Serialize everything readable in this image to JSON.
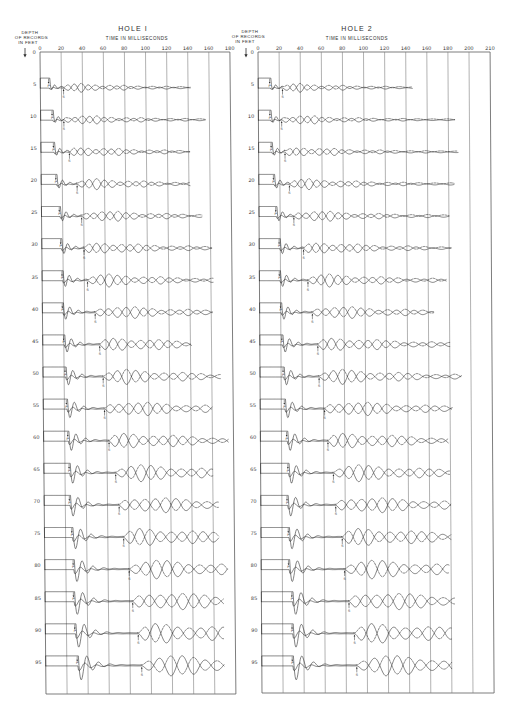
{
  "icons": {
    "depth_direction": "down-arrow"
  },
  "chart_data": [
    {
      "type": "line",
      "title": "HOLE I",
      "xlabel": "TIME IN MILLISECONDS",
      "ylabel": "DEPTH OF RECORDS IN FEET",
      "ylabel_lines": [
        "DEPTH",
        "OF RECORDS",
        "IN FEET"
      ],
      "x_ticks": [
        0,
        20,
        40,
        60,
        80,
        100,
        120,
        140,
        160,
        180
      ],
      "y_ticks": [
        0,
        5,
        10,
        15,
        20,
        25,
        30,
        35,
        40,
        45,
        50,
        55,
        60,
        65,
        70,
        75,
        80,
        85,
        90,
        95
      ],
      "xlim": [
        0,
        180
      ],
      "ylim": [
        0,
        95
      ],
      "y_direction": "down",
      "grid": true,
      "marker_labels": {
        "p": "P",
        "s": "S"
      },
      "records": [
        {
          "depth": 5,
          "p_ms": 9,
          "s_ms": 22,
          "end_ms": 142
        },
        {
          "depth": 10,
          "p_ms": 12,
          "s_ms": 22,
          "end_ms": 156
        },
        {
          "depth": 15,
          "p_ms": 13,
          "s_ms": 27,
          "end_ms": 141
        },
        {
          "depth": 20,
          "p_ms": 15,
          "s_ms": 34,
          "end_ms": 141
        },
        {
          "depth": 25,
          "p_ms": 18,
          "s_ms": 38,
          "end_ms": 152
        },
        {
          "depth": 30,
          "p_ms": 19,
          "s_ms": 40,
          "end_ms": 161
        },
        {
          "depth": 35,
          "p_ms": 20,
          "s_ms": 43,
          "end_ms": 162
        },
        {
          "depth": 40,
          "p_ms": 20,
          "s_ms": 50,
          "end_ms": 161
        },
        {
          "depth": 45,
          "p_ms": 21,
          "s_ms": 54,
          "end_ms": 141
        },
        {
          "depth": 50,
          "p_ms": 22,
          "s_ms": 57,
          "end_ms": 168
        },
        {
          "depth": 55,
          "p_ms": 23,
          "s_ms": 58,
          "end_ms": 160
        },
        {
          "depth": 60,
          "p_ms": 24,
          "s_ms": 62,
          "end_ms": 175
        },
        {
          "depth": 65,
          "p_ms": 25,
          "s_ms": 68,
          "end_ms": 160
        },
        {
          "depth": 70,
          "p_ms": 25,
          "s_ms": 71,
          "end_ms": 165
        },
        {
          "depth": 75,
          "p_ms": 27,
          "s_ms": 75,
          "end_ms": 165
        },
        {
          "depth": 80,
          "p_ms": 28,
          "s_ms": 80,
          "end_ms": 173
        },
        {
          "depth": 85,
          "p_ms": 28,
          "s_ms": 83,
          "end_ms": 169
        },
        {
          "depth": 90,
          "p_ms": 29,
          "s_ms": 88,
          "end_ms": 169
        },
        {
          "depth": 95,
          "p_ms": 31,
          "s_ms": 91,
          "end_ms": 169
        }
      ]
    },
    {
      "type": "line",
      "title": "HOLE 2",
      "xlabel": "TIME IN MILLISECONDS",
      "ylabel": "DEPTH OF RECORDS IN FEET",
      "ylabel_lines": [
        "DEPTH",
        "OF RECORDS",
        "IN FEET"
      ],
      "x_ticks": [
        0,
        20,
        40,
        60,
        80,
        100,
        120,
        140,
        160,
        180,
        200,
        210
      ],
      "y_ticks": [
        0,
        5,
        10,
        15,
        20,
        25,
        30,
        35,
        40,
        45,
        50,
        55,
        60,
        65,
        70,
        75,
        80,
        85,
        90,
        95
      ],
      "xlim": [
        0,
        210
      ],
      "ylim": [
        0,
        95
      ],
      "y_direction": "down",
      "grid": true,
      "marker_labels": {
        "p": "P",
        "s": "S"
      },
      "records": [
        {
          "depth": 5,
          "p_ms": 12,
          "s_ms": 23,
          "end_ms": 146
        },
        {
          "depth": 10,
          "p_ms": 12,
          "s_ms": 22,
          "end_ms": 186
        },
        {
          "depth": 15,
          "p_ms": 13,
          "s_ms": 25,
          "end_ms": 189
        },
        {
          "depth": 20,
          "p_ms": 15,
          "s_ms": 29,
          "end_ms": 185
        },
        {
          "depth": 25,
          "p_ms": 17,
          "s_ms": 33,
          "end_ms": 180
        },
        {
          "depth": 30,
          "p_ms": 20,
          "s_ms": 42,
          "end_ms": 182
        },
        {
          "depth": 35,
          "p_ms": 20,
          "s_ms": 46,
          "end_ms": 177
        },
        {
          "depth": 40,
          "p_ms": 21,
          "s_ms": 50,
          "end_ms": 165
        },
        {
          "depth": 45,
          "p_ms": 22,
          "s_ms": 55,
          "end_ms": 180
        },
        {
          "depth": 50,
          "p_ms": 23,
          "s_ms": 56,
          "end_ms": 191
        },
        {
          "depth": 55,
          "p_ms": 24,
          "s_ms": 61,
          "end_ms": 182
        },
        {
          "depth": 60,
          "p_ms": 26,
          "s_ms": 64,
          "end_ms": 178
        },
        {
          "depth": 65,
          "p_ms": 27,
          "s_ms": 69,
          "end_ms": 179
        },
        {
          "depth": 70,
          "p_ms": 26,
          "s_ms": 71,
          "end_ms": 180
        },
        {
          "depth": 75,
          "p_ms": 27,
          "s_ms": 77,
          "end_ms": 180
        },
        {
          "depth": 80,
          "p_ms": 27,
          "s_ms": 79,
          "end_ms": 178
        },
        {
          "depth": 85,
          "p_ms": 30,
          "s_ms": 83,
          "end_ms": 183
        },
        {
          "depth": 90,
          "p_ms": 30,
          "s_ms": 88,
          "end_ms": 180
        },
        {
          "depth": 95,
          "p_ms": 30,
          "s_ms": 90,
          "end_ms": 180
        }
      ]
    }
  ]
}
